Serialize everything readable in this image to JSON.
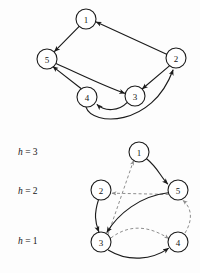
{
  "figure": {
    "background_color": "#fdfdfd",
    "ink_color": "#1b1b1b",
    "dashed_color": "#8e8e8e",
    "width": 200,
    "height": 273
  },
  "top_graph": {
    "name": "directed-graph-top",
    "nodes": [
      {
        "id": "1",
        "label": "1",
        "cx": 86,
        "cy": 19,
        "r": 10
      },
      {
        "id": "2",
        "label": "2",
        "cx": 176,
        "cy": 58,
        "r": 10
      },
      {
        "id": "3",
        "label": "3",
        "cx": 135,
        "cy": 96,
        "r": 10
      },
      {
        "id": "4",
        "label": "4",
        "cx": 87,
        "cy": 97,
        "r": 10
      },
      {
        "id": "5",
        "label": "5",
        "cx": 47,
        "cy": 59,
        "r": 10
      }
    ],
    "edges": [
      {
        "from": "1",
        "to": "5",
        "style": "solid",
        "shape": "straight"
      },
      {
        "from": "2",
        "to": "1",
        "style": "solid",
        "shape": "straight"
      },
      {
        "from": "2",
        "to": "3",
        "style": "solid",
        "shape": "straight"
      },
      {
        "from": "5",
        "to": "3",
        "style": "solid",
        "shape": "straight"
      },
      {
        "from": "4",
        "to": "5",
        "style": "solid",
        "shape": "straight"
      },
      {
        "from": "3",
        "to": "4",
        "style": "solid",
        "shape": "arc"
      },
      {
        "from": "4",
        "to": "2",
        "style": "solid",
        "shape": "long-arc"
      }
    ]
  },
  "levels": [
    {
      "id": "h3",
      "text": "h = 3",
      "var": "h",
      "rest": " = 3",
      "value": 3,
      "x": 18,
      "y": 152
    },
    {
      "id": "h2",
      "text": "h = 2",
      "var": "h",
      "rest": " = 2",
      "value": 2,
      "x": 18,
      "y": 191
    },
    {
      "id": "h1",
      "text": "h = 1",
      "var": "h",
      "rest": " = 1",
      "value": 1,
      "x": 18,
      "y": 241
    }
  ],
  "bottom_graph": {
    "name": "layered-graph-bottom",
    "nodes": [
      {
        "id": "1",
        "label": "1",
        "cx": 139,
        "cy": 152,
        "r": 10,
        "level": 3
      },
      {
        "id": "2",
        "label": "2",
        "cx": 101,
        "cy": 190,
        "r": 10,
        "level": 2
      },
      {
        "id": "5",
        "label": "5",
        "cx": 178,
        "cy": 190,
        "r": 10,
        "level": 2
      },
      {
        "id": "3",
        "label": "3",
        "cx": 101,
        "cy": 242,
        "r": 10,
        "level": 1
      },
      {
        "id": "4",
        "label": "4",
        "cx": 178,
        "cy": 242,
        "r": 10,
        "level": 1
      }
    ],
    "edges": [
      {
        "from": "1",
        "to": "5",
        "style": "solid",
        "shape": "curve"
      },
      {
        "from": "2",
        "to": "3",
        "style": "solid",
        "shape": "curve"
      },
      {
        "from": "5",
        "to": "3",
        "style": "solid",
        "shape": "curve"
      },
      {
        "from": "3",
        "to": "4",
        "style": "solid",
        "shape": "curve"
      },
      {
        "from": "3",
        "to": "1",
        "style": "dashed",
        "shape": "straight"
      },
      {
        "from": "5",
        "to": "2",
        "style": "dashed",
        "shape": "straight"
      },
      {
        "from": "3",
        "to": "4",
        "style": "dashed",
        "shape": "curve"
      },
      {
        "from": "4",
        "to": "5",
        "style": "dashed",
        "shape": "curve"
      }
    ]
  }
}
